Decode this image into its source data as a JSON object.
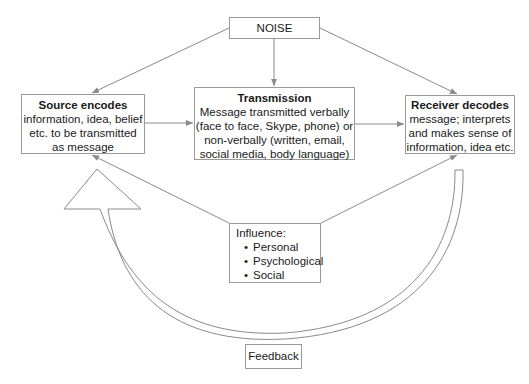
{
  "diagram": {
    "noise": {
      "label": "NOISE"
    },
    "source": {
      "title": "Source encodes",
      "body": "information, idea, belief etc. to be transmitted as message"
    },
    "transmission": {
      "title": "Transmission",
      "body": "Message transmitted verbally (face to face, Skype, phone) or non-verbally (written, email, social media, body language)"
    },
    "receiver": {
      "title": "Receiver decodes",
      "body": "message; interprets and makes sense of information, idea etc."
    },
    "influence": {
      "title": "Influence:",
      "items": [
        "Personal",
        "Psychological",
        "Social"
      ]
    },
    "feedback": {
      "label": "Feedback"
    },
    "colors": {
      "line": "#8a8a8a",
      "border": "#9a9a9a",
      "text": "#1a1a1a"
    }
  }
}
